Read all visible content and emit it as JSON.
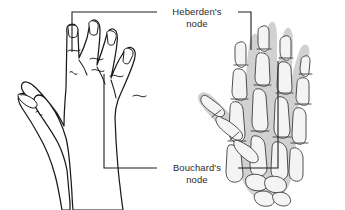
{
  "figure": {
    "background_color": "#ffffff",
    "line_color": "#1a1a1a",
    "text_color": "#2b2b2b",
    "bone_fill_color": "#f4f4f4",
    "soft_tissue_color": "#c9c9c9"
  },
  "callouts": [
    {
      "id": "heberden",
      "label_line1": "Heberden's",
      "label_line2": "node",
      "joint": "distal interphalangeal",
      "text_x": 197,
      "text_y1": 14,
      "text_y2": 25
    },
    {
      "id": "bouchard",
      "label_line1": "Bouchard's",
      "label_line2": "node",
      "joint": "proximal interphalangeal",
      "text_x": 197,
      "text_y1": 168,
      "text_y2": 179
    }
  ],
  "panels": {
    "left": {
      "name": "line-drawn-hand",
      "description": "Outline drawing of a hand showing swollen finger joints"
    },
    "right": {
      "name": "skeletal-hand",
      "description": "Skeletal radiograph-style hand with soft tissue shadow"
    }
  }
}
